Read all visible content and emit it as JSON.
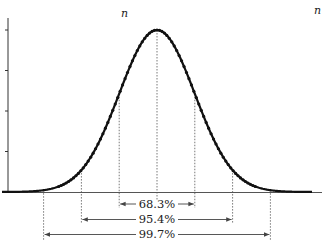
{
  "chart_data": {
    "type": "line",
    "title": "",
    "subtitle": "Normal distribution with 1σ, 2σ, 3σ intervals",
    "xlabel": "",
    "ylabel": "",
    "top_labels": [
      "n",
      "n"
    ],
    "curve": {
      "mean": 0,
      "sd": 1,
      "x_range": [
        -4,
        4
      ],
      "style": "dotted-markers",
      "color": "#111111"
    },
    "y_ticks": 5,
    "grid": false,
    "intervals": [
      {
        "sigma": 1,
        "label": "68.3%",
        "bounds": [
          -1,
          1
        ]
      },
      {
        "sigma": 2,
        "label": "95.4%",
        "bounds": [
          -2,
          2
        ]
      },
      {
        "sigma": 3,
        "label": "99.7%",
        "bounds": [
          -3,
          3
        ]
      }
    ],
    "x": [
      -4,
      -3,
      -2,
      -1,
      0,
      1,
      2,
      3,
      4
    ],
    "values": [
      0.0001,
      0.0044,
      0.054,
      0.242,
      0.399,
      0.242,
      0.054,
      0.0044,
      0.0001
    ]
  },
  "labels": {
    "n_left": "n",
    "n_right": "n",
    "pct_1": "68.3%",
    "pct_2": "95.4%",
    "pct_3": "99.7%"
  },
  "colors": {
    "curve": "#111111",
    "axis": "#333333",
    "guide": "#555555"
  }
}
